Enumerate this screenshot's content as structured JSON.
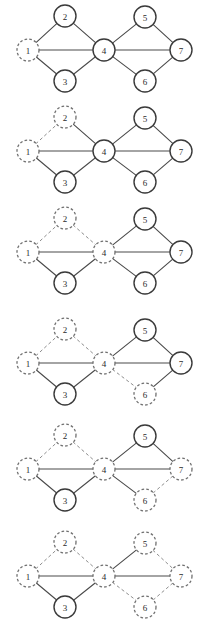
{
  "figure": {
    "width": 204,
    "height": 626,
    "panel_count": 6,
    "panel_height": 100,
    "panel_spacing": 101,
    "colors": {
      "solid_edge": "#4a4a4a",
      "dashed_edge": "#8d8d8d",
      "solid_node_stroke": "#3a3a3a",
      "dashed_node_stroke": "#6f6f6f",
      "node_fill": "#ffffff",
      "label": "#2b2b2b",
      "background": "#ffffff"
    }
  },
  "graph": {
    "node_radius": 11,
    "nodes": [
      {
        "id": "1",
        "label": "1",
        "x": 28,
        "y": 50
      },
      {
        "id": "2",
        "label": "2",
        "x": 65,
        "y": 16
      },
      {
        "id": "3",
        "label": "3",
        "x": 65,
        "y": 81
      },
      {
        "id": "4",
        "label": "4",
        "x": 104,
        "y": 50
      },
      {
        "id": "5",
        "label": "5",
        "x": 145,
        "y": 17
      },
      {
        "id": "6",
        "label": "6",
        "x": 145,
        "y": 81
      },
      {
        "id": "7",
        "label": "7",
        "x": 181,
        "y": 50
      }
    ],
    "edges": [
      {
        "id": "1-2",
        "from": "1",
        "to": "2"
      },
      {
        "id": "1-3",
        "from": "1",
        "to": "3"
      },
      {
        "id": "1-4",
        "from": "1",
        "to": "4"
      },
      {
        "id": "2-4",
        "from": "2",
        "to": "4"
      },
      {
        "id": "3-4",
        "from": "3",
        "to": "4"
      },
      {
        "id": "4-5",
        "from": "4",
        "to": "5"
      },
      {
        "id": "4-6",
        "from": "4",
        "to": "6"
      },
      {
        "id": "4-7",
        "from": "4",
        "to": "7"
      },
      {
        "id": "5-7",
        "from": "5",
        "to": "7"
      },
      {
        "id": "6-7",
        "from": "6",
        "to": "7"
      }
    ]
  },
  "panels": [
    {
      "index": 1,
      "name": "panel-1",
      "top": 0,
      "dashed_nodes": [
        "1"
      ],
      "dashed_edges": []
    },
    {
      "index": 2,
      "name": "panel-2",
      "top": 101,
      "dashed_nodes": [
        "1",
        "2"
      ],
      "dashed_edges": [
        "1-2"
      ]
    },
    {
      "index": 3,
      "name": "panel-3",
      "top": 202,
      "dashed_nodes": [
        "1",
        "2",
        "4"
      ],
      "dashed_edges": [
        "1-2",
        "2-4"
      ]
    },
    {
      "index": 4,
      "name": "panel-4",
      "top": 313,
      "dashed_nodes": [
        "1",
        "2",
        "4",
        "6"
      ],
      "dashed_edges": [
        "1-2",
        "2-4",
        "4-6"
      ]
    },
    {
      "index": 5,
      "name": "panel-5",
      "top": 419,
      "dashed_nodes": [
        "1",
        "2",
        "4",
        "6",
        "7"
      ],
      "dashed_edges": [
        "1-2",
        "2-4",
        "6-7"
      ]
    },
    {
      "index": 6,
      "name": "panel-6",
      "top": 526,
      "dashed_nodes": [
        "1",
        "2",
        "4",
        "5",
        "6",
        "7"
      ],
      "dashed_edges": [
        "1-2",
        "2-4",
        "4-6",
        "5-7",
        "6-7"
      ]
    }
  ]
}
